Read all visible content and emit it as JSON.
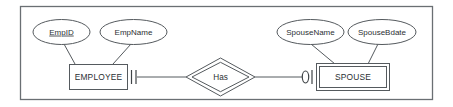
{
  "diagram": {
    "entities": [
      {
        "id": "employee",
        "label": "EMPLOYEE",
        "kind": "strong-entity",
        "attributes": [
          {
            "label": "EmpID",
            "key": true
          },
          {
            "label": "EmpName",
            "key": false
          }
        ]
      },
      {
        "id": "spouse",
        "label": "SPOUSE",
        "kind": "weak-entity",
        "attributes": [
          {
            "label": "SpouseName",
            "key": false
          },
          {
            "label": "SpouseBdate",
            "key": false
          }
        ]
      }
    ],
    "relationship": {
      "id": "has",
      "label": "Has",
      "kind": "identifying-relationship",
      "left_cardinality": "exactly-one",
      "right_cardinality": "zero-or-one"
    },
    "colors": {
      "stroke": "#555a5e",
      "frame": "#6a6f73",
      "text": "#2b2f33",
      "background": "#ffffff"
    }
  }
}
